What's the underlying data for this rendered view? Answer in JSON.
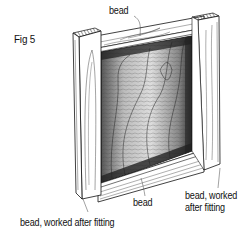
{
  "figure": {
    "label": "Fig 5"
  },
  "annotations": {
    "bead_top": "bead",
    "bead_bottom": "bead",
    "bead_worked_left": "bead, worked after fitting",
    "bead_worked_right_line1": "bead, worked",
    "bead_worked_right_line2": "after fitting"
  },
  "colors": {
    "ink": "#111111",
    "paper": "#ffffff",
    "panel_shade": "#6a6a6a"
  }
}
